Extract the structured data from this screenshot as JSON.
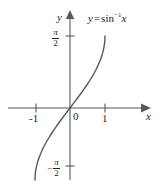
{
  "figure": {
    "background_color": "#ffffff",
    "width": 162,
    "height": 187
  },
  "chart_data": {
    "type": "line",
    "title": "",
    "subtitle": "",
    "xlabel": "x",
    "ylabel": "y",
    "function": "y = sin^-1 x",
    "annotations": [
      {
        "text": "y = sin⁻¹x",
        "role": "curve-equation",
        "x": 1.05,
        "y": 1.45
      }
    ],
    "grid": false,
    "legend": null,
    "axes_style": "arrowed-cartesian",
    "xlim": [
      -1.85,
      1.95
    ],
    "ylim": [
      -1.95,
      1.95
    ],
    "xticks": [
      -1,
      1
    ],
    "xtick_labels": [
      "-1",
      "1"
    ],
    "yticks": [
      1.5707963,
      -1.5707963
    ],
    "ytick_labels": [
      "π/2",
      "-π/2"
    ],
    "origin_label": "0",
    "series": [
      {
        "name": "y = sin^-1 x",
        "color": "#58595b",
        "linewidth": 1.4,
        "x": [
          -1.0,
          -0.995,
          -0.98,
          -0.95,
          -0.9,
          -0.8,
          -0.7,
          -0.6,
          -0.5,
          -0.4,
          -0.3,
          -0.2,
          -0.1,
          0.0,
          0.1,
          0.2,
          0.3,
          0.4,
          0.5,
          0.6,
          0.7,
          0.8,
          0.9,
          0.95,
          0.98,
          0.995,
          1.0
        ],
        "y": [
          -1.5708,
          -1.4709,
          -1.3713,
          -1.2532,
          -1.1198,
          -0.9273,
          -0.7754,
          -0.6435,
          -0.5236,
          -0.4115,
          -0.3047,
          -0.2014,
          -0.1002,
          0.0,
          0.1002,
          0.2014,
          0.3047,
          0.4115,
          0.5236,
          0.6435,
          0.7754,
          0.9273,
          1.1198,
          1.2532,
          1.3713,
          1.4709,
          1.5708
        ]
      }
    ]
  },
  "labels": {
    "y_axis": "y",
    "x_axis": "x",
    "origin": "0",
    "x_tick_neg1": "-1",
    "x_tick_pos1": "1",
    "pi_symbol": "π",
    "two": "2",
    "minus": "−"
  },
  "equation": {
    "lhs": "y",
    "operator": "=",
    "func": "sin",
    "exponent": "−1",
    "arg": "x"
  },
  "colors": {
    "curve": "#58595b",
    "axis": "#58595b",
    "text": "#231f20",
    "background": "#ffffff"
  }
}
